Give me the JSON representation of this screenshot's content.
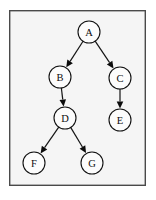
{
  "figure": {
    "frame": {
      "x": 9,
      "y": 10,
      "width": 137,
      "height": 176,
      "background_color": "#f5f5f5",
      "border_color": "#4a4a4a"
    },
    "page_background": "#ffffff"
  },
  "graph": {
    "type": "directed-tree",
    "node_radius": 11,
    "node_fill": "#fcfcfc",
    "node_stroke": "#111111",
    "edge_color": "#141414",
    "arrow_style": "solid-filled-triangle",
    "nodes": [
      {
        "id": "A",
        "label": "A",
        "cx": 89,
        "cy": 32
      },
      {
        "id": "B",
        "label": "B",
        "cx": 60,
        "cy": 77
      },
      {
        "id": "C",
        "label": "C",
        "cx": 120,
        "cy": 78
      },
      {
        "id": "D",
        "label": "D",
        "cx": 65,
        "cy": 118
      },
      {
        "id": "E",
        "label": "E",
        "cx": 120,
        "cy": 120
      },
      {
        "id": "F",
        "label": "F",
        "cx": 34,
        "cy": 163
      },
      {
        "id": "G",
        "label": "G",
        "cx": 92,
        "cy": 163
      }
    ],
    "edges": [
      {
        "from": "A",
        "to": "B",
        "directed": true
      },
      {
        "from": "A",
        "to": "C",
        "directed": true
      },
      {
        "from": "B",
        "to": "D",
        "directed": true
      },
      {
        "from": "C",
        "to": "E",
        "directed": true
      },
      {
        "from": "D",
        "to": "F",
        "directed": true
      },
      {
        "from": "D",
        "to": "G",
        "directed": true
      }
    ]
  }
}
